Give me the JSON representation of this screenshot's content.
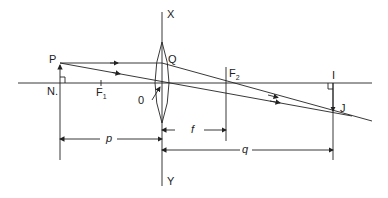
{
  "diagram": {
    "labels": {
      "x_axis_top": "X",
      "y_axis_bottom": "Y",
      "object_tip": "P",
      "object_base": "N.",
      "focus_1": "F",
      "focus_1_sub": "1",
      "focus_2": "F",
      "focus_2_sub": "2",
      "optical_center": "0",
      "lens_point": "Q",
      "image_base": "I",
      "image_tip": "J",
      "object_distance": "p",
      "focal_length": "f",
      "image_distance": "q"
    },
    "colors": {
      "line": "#222222",
      "background": "#ffffff"
    }
  }
}
